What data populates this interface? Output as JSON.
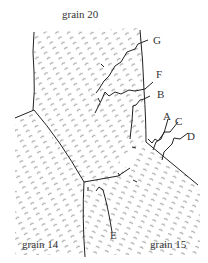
{
  "labels": {
    "grain_top": "grain 20",
    "grain_left": "grain 14",
    "grain_right": "grain 15",
    "A": "A",
    "B": "B",
    "C": "C",
    "D": "D",
    "E": "E",
    "F": "F",
    "G": "G"
  },
  "colors": {
    "line": "#222222",
    "hatch": "#555555",
    "text": "#333333"
  }
}
